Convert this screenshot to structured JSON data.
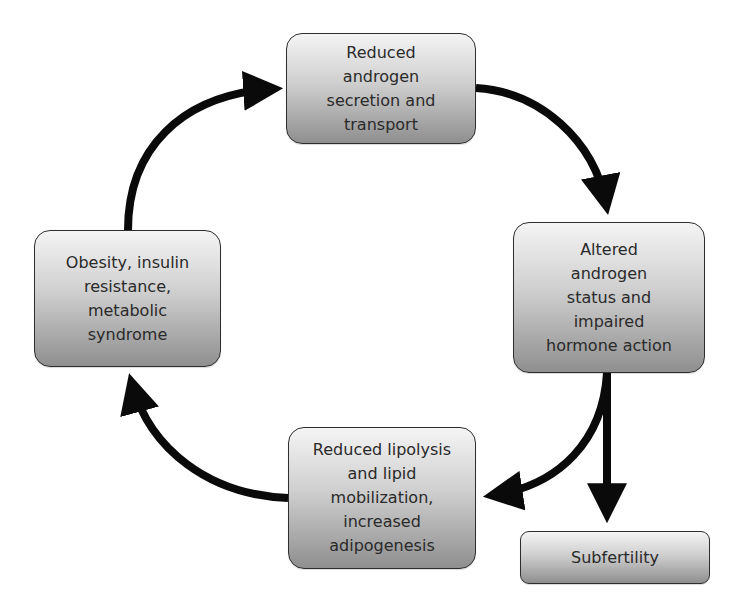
{
  "diagram": {
    "type": "cycle",
    "nodes": [
      {
        "id": "top",
        "label": "Reduced\nandrogen\nsecretion and\ntransport"
      },
      {
        "id": "right",
        "label": "Altered\nandrogen\nstatus and\nimpaired\nhormone action"
      },
      {
        "id": "bottom",
        "label": "Reduced lipolysis\nand lipid\nmobilization,\nincreased\nadipogenesis"
      },
      {
        "id": "left",
        "label": "Obesity, insulin\nresistance,\nmetabolic\nsyndrome"
      },
      {
        "id": "outcome",
        "label": "Subfertility"
      }
    ],
    "edges": [
      {
        "from": "left",
        "to": "top"
      },
      {
        "from": "top",
        "to": "right"
      },
      {
        "from": "right",
        "to": "bottom"
      },
      {
        "from": "bottom",
        "to": "left"
      },
      {
        "from": "right",
        "to": "outcome"
      }
    ],
    "colors": {
      "arrow": "#0a0a0a",
      "box_border": "#2e2e2e",
      "box_gradient_top": "#f4f4f4",
      "box_gradient_bottom": "#8f8f8f",
      "text": "#2a2a2a"
    }
  }
}
